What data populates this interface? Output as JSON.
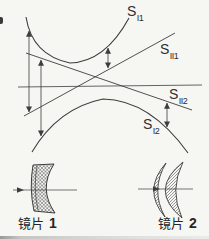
{
  "figure": {
    "background_color": "#f6f6f3",
    "ink_color": "#3d3d3d",
    "curve_labels": {
      "s_i1": {
        "base": "S",
        "sub": "I1"
      },
      "s_ii1": {
        "base": "S",
        "sub": "II1"
      },
      "s_ii2": {
        "base": "S",
        "sub": "II2"
      },
      "s_i2": {
        "base": "S",
        "sub": "I2"
      }
    },
    "lens_labels": {
      "lens1": {
        "name": "镜片",
        "number": "1"
      },
      "lens2": {
        "name": "镜片",
        "number": "2"
      }
    }
  }
}
